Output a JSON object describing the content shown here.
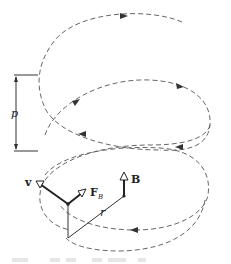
{
  "figure": {
    "labels": {
      "pitch": "p",
      "velocity": "v",
      "force": "F",
      "force_subscript": "B",
      "field": "B",
      "radius": "r"
    },
    "colors": {
      "ink": "#222222",
      "path": "#555555",
      "background": "#ffffff"
    }
  }
}
